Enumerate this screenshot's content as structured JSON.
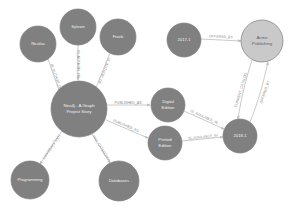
{
  "diagram": {
    "type": "graph-network",
    "title": "",
    "background": "#ffffff",
    "colors": {
      "node_gray": "#808080",
      "node_light": "#c9c9c9",
      "node_stroke": "#7d7d7d",
      "edge": "#bdbdbd",
      "node_text": "#f2f2f2",
      "edge_text": "#8a8a8a"
    },
    "nodes": [
      {
        "id": "nicolas",
        "label": "Nicolas",
        "cx": 38,
        "cy": 44,
        "r": 18,
        "fill": "#808080",
        "text_color": "#f2f2f2",
        "lines": [
          "Nicolas"
        ]
      },
      {
        "id": "sylvain",
        "label": "Sylvain",
        "cx": 78,
        "cy": 27,
        "r": 18,
        "fill": "#808080",
        "text_color": "#f2f2f2",
        "lines": [
          "Sylvain"
        ]
      },
      {
        "id": "frank",
        "label": "Frank",
        "cx": 118,
        "cy": 37,
        "r": 18,
        "fill": "#808080",
        "text_color": "#f2f2f2",
        "lines": [
          "Frank"
        ]
      },
      {
        "id": "book",
        "label": "Neo4j - A Graph Project Story",
        "cx": 79,
        "cy": 109,
        "r": 28,
        "fill": "#808080",
        "text_color": "#f2f2f2",
        "lines": [
          "Neo4j - A Graph",
          "Project Story"
        ]
      },
      {
        "id": "programming",
        "label": "Programming",
        "cx": 30,
        "cy": 180,
        "r": 19,
        "fill": "#808080",
        "text_color": "#f2f2f2",
        "lines": [
          "Programming"
        ]
      },
      {
        "id": "databases",
        "label": "Databases",
        "cx": 119,
        "cy": 181,
        "r": 20,
        "fill": "#808080",
        "text_color": "#f2f2f2",
        "lines": [
          "Databases"
        ]
      },
      {
        "id": "digital",
        "label": "Digital Edition",
        "cx": 168,
        "cy": 105,
        "r": 17,
        "fill": "#808080",
        "text_color": "#f2f2f2",
        "lines": [
          "Digital",
          "Edition"
        ]
      },
      {
        "id": "printed",
        "label": "Printed Edition",
        "cx": 165,
        "cy": 143,
        "r": 17,
        "fill": "#808080",
        "text_color": "#f2f2f2",
        "lines": [
          "Printed",
          "Edition"
        ]
      },
      {
        "id": "cat2018",
        "label": "2018-1",
        "cx": 240,
        "cy": 136,
        "r": 17,
        "fill": "#808080",
        "text_color": "#f2f2f2",
        "lines": [
          "2018-1"
        ]
      },
      {
        "id": "cat2017",
        "label": "2017-1",
        "cx": 184,
        "cy": 40,
        "r": 17,
        "fill": "#808080",
        "text_color": "#f2f2f2",
        "lines": [
          "2017-1"
        ]
      },
      {
        "id": "acme",
        "label": "Acme Publishing",
        "cx": 262,
        "cy": 41,
        "r": 21,
        "fill": "#c9c9c9",
        "text_color": "#5e5e5e",
        "lines": [
          "Acme",
          "Publishing"
        ]
      }
    ],
    "relationships": [
      {
        "id": "r1",
        "type": "IS_AUTHOR_OF",
        "from": "nicolas",
        "to": "book",
        "label": "IS_AUTHOR_OF",
        "lx": 56,
        "ly": 77,
        "rot": 49
      },
      {
        "id": "r2",
        "type": "IS_AUTHOR_OF",
        "from": "sylvain",
        "to": "book",
        "label": "IS_AUTHOR_OF",
        "lx": 79,
        "ly": 68,
        "rot": 87
      },
      {
        "id": "r3",
        "type": "IS_AUTHOR_OF",
        "from": "frank",
        "to": "book",
        "label": "IS_AUTHOR_OF",
        "lx": 103,
        "ly": 74,
        "rot": -63
      },
      {
        "id": "r4",
        "type": "HAS_CATEGORY",
        "from": "book",
        "to": "programming",
        "label": "HAS_CATEGORY",
        "lx": 50,
        "ly": 150,
        "rot": -58
      },
      {
        "id": "r5",
        "type": "HAS_CATEGORY",
        "from": "book",
        "to": "databases",
        "label": "HAS_CATEGORY",
        "lx": 100,
        "ly": 150,
        "rot": 62
      },
      {
        "id": "r6",
        "type": "PUBLISHED_AS",
        "from": "book",
        "to": "digital",
        "label": "PUBLISHED_AS",
        "lx": 126,
        "ly": 105,
        "rot": 0
      },
      {
        "id": "r7",
        "type": "PUBLISHED_AS",
        "from": "book",
        "to": "printed",
        "label": "PUBLISHED_AS",
        "lx": 124,
        "ly": 129,
        "rot": 14
      },
      {
        "id": "r8",
        "type": "IS_AVAILABLE_IN",
        "from": "digital",
        "to": "cat2018",
        "label": "IS_AVAILABLE_IN",
        "lx": 203,
        "ly": 118,
        "rot": 18
      },
      {
        "id": "r9",
        "type": "IS_AVAILABLE_IN",
        "from": "printed",
        "to": "cat2018",
        "label": "IS_AVAILABLE_IN",
        "lx": 203,
        "ly": 141,
        "rot": -6
      },
      {
        "id": "r10",
        "type": "OFFERED_BY",
        "from": "cat2017",
        "to": "acme",
        "label": "OFFERED_BY",
        "lx": 221,
        "ly": 36,
        "rot": -5
      },
      {
        "id": "r11",
        "type": "CURRENT_CATALOG",
        "from": "acme",
        "to": "cat2018",
        "label": "CURRENT_CATALOG",
        "lx": 243,
        "ly": 90,
        "rot": 72
      },
      {
        "id": "r12",
        "type": "OFFERED_BY",
        "from": "cat2018",
        "to": "acme",
        "label": "OFFERED_BY",
        "lx": 265,
        "ly": 90,
        "rot": 74
      }
    ]
  }
}
